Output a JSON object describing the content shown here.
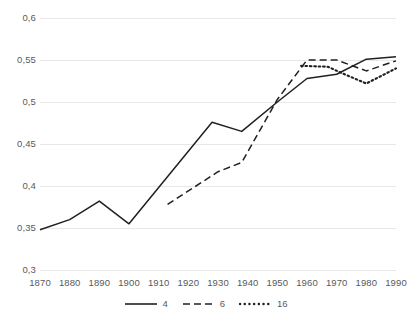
{
  "chart_data": {
    "type": "line",
    "title": "",
    "subtitle": "",
    "xlabel": "",
    "ylabel": "",
    "xlim": [
      1870,
      1990
    ],
    "ylim": [
      0.3,
      0.6
    ],
    "grid": true,
    "grid_axis": "y",
    "legend_position": "bottom-center",
    "decimal_separator": ",",
    "x_ticks": [
      1870,
      1880,
      1890,
      1900,
      1910,
      1920,
      1930,
      1940,
      1950,
      1960,
      1970,
      1980,
      1990
    ],
    "x_tick_labels": [
      "1870",
      "1880",
      "1890",
      "1900",
      "1910",
      "1920",
      "1930",
      "1940",
      "1950",
      "1960",
      "1970",
      "1980",
      "1990"
    ],
    "y_ticks": [
      0.3,
      0.35,
      0.4,
      0.45,
      0.5,
      0.55,
      0.6
    ],
    "y_tick_labels": [
      "0,3",
      "0,35",
      "0,4",
      "0,45",
      "0,5",
      "0,55",
      "0,6"
    ],
    "series": [
      {
        "name": "4",
        "style": "solid",
        "color": "#231f20",
        "points": [
          [
            1870,
            0.348
          ],
          [
            1880,
            0.36
          ],
          [
            1890,
            0.382
          ],
          [
            1900,
            0.355
          ],
          [
            1928,
            0.476
          ],
          [
            1938,
            0.465
          ],
          [
            1950,
            0.5
          ],
          [
            1960,
            0.528
          ],
          [
            1970,
            0.533
          ],
          [
            1980,
            0.551
          ],
          [
            1990,
            0.554
          ]
        ]
      },
      {
        "name": "6",
        "style": "dashed",
        "color": "#231f20",
        "points": [
          [
            1913,
            0.378
          ],
          [
            1930,
            0.417
          ],
          [
            1938,
            0.428
          ],
          [
            1950,
            0.503
          ],
          [
            1960,
            0.55
          ],
          [
            1970,
            0.55
          ],
          [
            1980,
            0.537
          ],
          [
            1990,
            0.549
          ]
        ]
      },
      {
        "name": "16",
        "style": "dotted",
        "color": "#231f20",
        "points": [
          [
            1958,
            0.543
          ],
          [
            1967,
            0.542
          ],
          [
            1972,
            0.534
          ],
          [
            1980,
            0.522
          ],
          [
            1990,
            0.54
          ]
        ]
      }
    ]
  },
  "legend": {
    "items": [
      {
        "label": "4",
        "style": "solid"
      },
      {
        "label": "6",
        "style": "dashed"
      },
      {
        "label": "16",
        "style": "dotted"
      }
    ]
  },
  "colors": {
    "line": "#231f20",
    "grid": "#e8e8e8",
    "text": "#58595b",
    "background": "#ffffff"
  }
}
